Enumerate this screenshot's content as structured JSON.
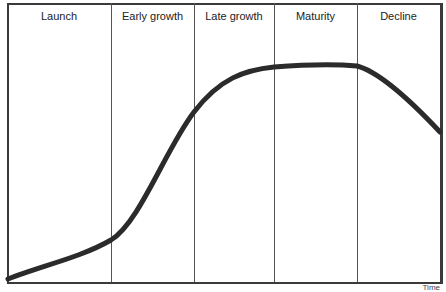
{
  "diagram": {
    "title": "",
    "stages": [
      {
        "label": "Launch",
        "x_start": 7,
        "x_end": 111
      },
      {
        "label": "Early growth",
        "x_start": 111,
        "x_end": 194
      },
      {
        "label": "Late growth",
        "x_start": 194,
        "x_end": 274
      },
      {
        "label": "Maturity",
        "x_start": 274,
        "x_end": 357
      },
      {
        "label": "Decline",
        "x_start": 357,
        "x_end": 440
      }
    ],
    "x_axis_label": "Time",
    "curve_color": "#2b2b2b",
    "line_color": "#555555"
  }
}
